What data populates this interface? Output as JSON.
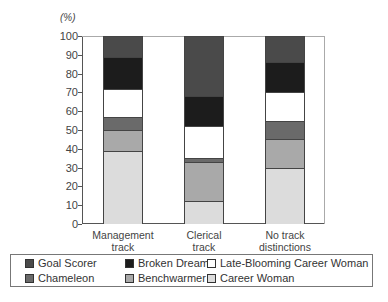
{
  "chart_data": {
    "type": "bar",
    "stacked": true,
    "title": "",
    "unit_label": "(%)",
    "xlabel": "",
    "ylabel": "(%)",
    "ylim": [
      0,
      100
    ],
    "yticks": [
      0,
      10,
      20,
      30,
      40,
      50,
      60,
      70,
      80,
      90,
      100
    ],
    "categories": [
      "Management track",
      "Clerical track",
      "No track distinctions"
    ],
    "category_lines": [
      [
        "Management",
        "track"
      ],
      [
        "Clerical",
        "track"
      ],
      [
        "No track",
        "distinctions"
      ]
    ],
    "series": [
      {
        "name": "Career Woman",
        "color": "#dcdcdc",
        "values": [
          39,
          12,
          30
        ]
      },
      {
        "name": "Benchwarmer",
        "color": "#a9a9a9",
        "values": [
          11,
          21,
          15
        ]
      },
      {
        "name": "Chameleon",
        "color": "#6a6a6a",
        "values": [
          7,
          2,
          10
        ]
      },
      {
        "name": "Late-Blooming Career Woman",
        "color": "#ffffff",
        "values": [
          15,
          17,
          15
        ]
      },
      {
        "name": "Broken Dream",
        "color": "#1c1c1c",
        "values": [
          17,
          16,
          16
        ]
      },
      {
        "name": "Goal Scorer",
        "color": "#4a4a4a",
        "values": [
          11,
          32,
          14
        ]
      }
    ],
    "legend": {
      "position": "bottom",
      "order": [
        "Goal Scorer",
        "Broken Dream",
        "Late-Blooming Career Woman",
        "Chameleon",
        "Benchwarmer",
        "Career Woman"
      ]
    },
    "grid": false
  }
}
